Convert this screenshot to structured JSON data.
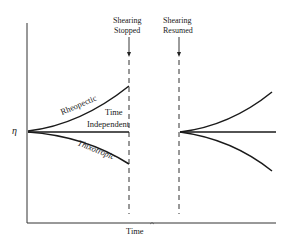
{
  "diagram": {
    "type": "viscosity-vs-time",
    "y_axis_label": "η",
    "x_axis_label": "Time",
    "events": [
      {
        "id": "stopped",
        "label_line1": "Shearing",
        "label_line2": "Stopped"
      },
      {
        "id": "resumed",
        "label_line1": "Shearing",
        "label_line2": "Resumed"
      }
    ],
    "curves": [
      {
        "id": "rheopectic",
        "label": "Rheopectic",
        "behavior": "increasing"
      },
      {
        "id": "time-independent",
        "label_line1": "Time",
        "label_line2": "Independent",
        "behavior": "constant"
      },
      {
        "id": "thixotropic",
        "label": "Thixotropic",
        "behavior": "decreasing"
      }
    ]
  }
}
